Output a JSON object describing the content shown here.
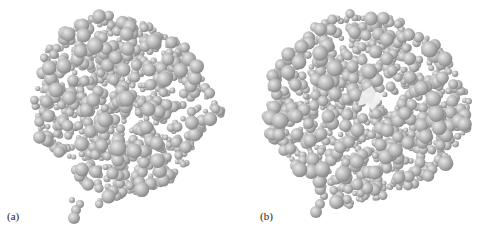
{
  "figure": {
    "panels": [
      {
        "id": "a",
        "label": "(a)",
        "description": "space-filling sphere model of protein, intact surface"
      },
      {
        "id": "b",
        "label": "(b)",
        "description": "space-filling sphere model of protein with bright cavity/pocket exposed"
      }
    ],
    "colors": {
      "sphere_base": "#b4b4b4",
      "sphere_highlight": "#e8e8e8",
      "sphere_shadow": "#8a8a8a",
      "cavity": "#f2f2f2",
      "background": "#ffffff"
    }
  }
}
